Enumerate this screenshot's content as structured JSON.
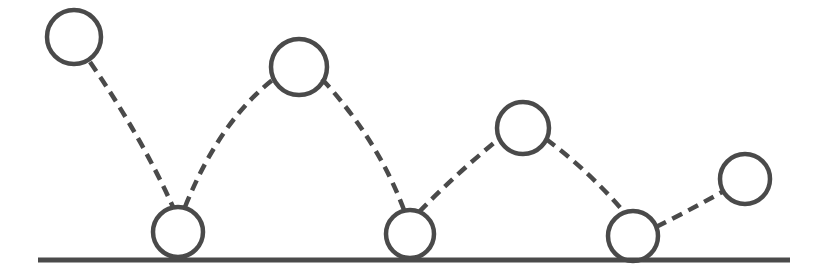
{
  "figure": {
    "background_color": "#ffffff",
    "canvas": {
      "width": 826,
      "height": 280
    }
  },
  "style": {
    "ink_color": "#4a4a4a",
    "ball_stroke_color": "#4a4a4a",
    "ball_fill_color": "none",
    "ball_stroke_width": 4.5,
    "arc_stroke_color": "#4a4a4a",
    "arc_stroke_width": 4.5,
    "arc_dash_pattern": "11 7",
    "ground_stroke_color": "#4a4a4a",
    "ground_stroke_width": 5
  },
  "ground": {
    "label": "ground-surface",
    "x1": 38,
    "x2": 790,
    "y": 260
  },
  "balls": [
    {
      "label": "ball-release",
      "phase": "release",
      "bounce_index": 0,
      "cx": 74,
      "cy": 37,
      "r": 27
    },
    {
      "label": "ball-impact-1",
      "phase": "impact",
      "bounce_index": 1,
      "cx": 178,
      "cy": 232,
      "r": 25
    },
    {
      "label": "ball-apex-1",
      "phase": "apex",
      "bounce_index": 1,
      "cx": 299,
      "cy": 67,
      "r": 28
    },
    {
      "label": "ball-impact-2",
      "phase": "impact",
      "bounce_index": 2,
      "cx": 410,
      "cy": 234,
      "r": 24
    },
    {
      "label": "ball-apex-2",
      "phase": "apex",
      "bounce_index": 2,
      "cx": 523,
      "cy": 128,
      "r": 26
    },
    {
      "label": "ball-impact-3",
      "phase": "impact",
      "bounce_index": 3,
      "cx": 633,
      "cy": 236,
      "r": 25
    },
    {
      "label": "ball-apex-3",
      "phase": "apex",
      "bounce_index": 3,
      "cx": 745,
      "cy": 179,
      "r": 25
    }
  ],
  "arcs": [
    {
      "label": "arc-fall-0",
      "from": "ball-release",
      "to": "ball-impact-1",
      "path": "M 90 62 Q 141 136 173 207"
    },
    {
      "label": "arc-rise-1",
      "from": "ball-impact-1",
      "to": "ball-apex-1",
      "path": "M 185 207 Q 220 120 275 78"
    },
    {
      "label": "arc-fall-1",
      "from": "ball-apex-1",
      "to": "ball-impact-2",
      "path": "M 322 79 Q 378 140 404 210"
    },
    {
      "label": "arc-rise-2",
      "from": "ball-impact-2",
      "to": "ball-apex-2",
      "path": "M 419 212 Q 458 172 500 138"
    },
    {
      "label": "arc-fall-2",
      "from": "ball-apex-2",
      "to": "ball-impact-3",
      "path": "M 546 139 Q 590 172 624 212"
    },
    {
      "label": "arc-rise-3",
      "from": "ball-impact-3",
      "to": "ball-apex-3",
      "path": "M 656 227 Q 690 210 722 192"
    }
  ],
  "chart_data": {
    "type": "scatter",
    "xlabel": "Horizontal position (px)",
    "ylabel": "Height above ground (px)",
    "xlim": [
      0,
      826
    ],
    "ylim": [
      0,
      280
    ],
    "grid": false,
    "legend": "none",
    "series": [
      {
        "name": "Ball positions",
        "points": [
          {
            "x": 74,
            "y": 37,
            "height_above_ground": 223,
            "phase": "release"
          },
          {
            "x": 178,
            "y": 232,
            "height_above_ground": 28,
            "phase": "impact"
          },
          {
            "x": 299,
            "y": 67,
            "height_above_ground": 193,
            "phase": "apex"
          },
          {
            "x": 410,
            "y": 234,
            "height_above_ground": 26,
            "phase": "impact"
          },
          {
            "x": 523,
            "y": 128,
            "height_above_ground": 132,
            "phase": "apex"
          },
          {
            "x": 633,
            "y": 236,
            "height_above_ground": 24,
            "phase": "impact"
          },
          {
            "x": 745,
            "y": 179,
            "height_above_ground": 81,
            "phase": "apex"
          }
        ]
      }
    ],
    "annotations": [
      {
        "name": "ground-surface",
        "type": "horizontal-line",
        "y": 260,
        "x_start": 38,
        "x_end": 790
      }
    ]
  }
}
